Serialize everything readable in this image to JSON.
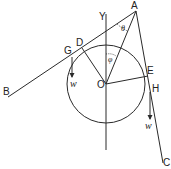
{
  "diagram": {
    "points": {
      "A": "A",
      "B": "B",
      "C": "C",
      "D": "D",
      "E": "E",
      "G": "G",
      "H": "H",
      "O": "O",
      "Y": "Y"
    },
    "angles": {
      "theta": "θ",
      "phi": "φ"
    },
    "weights": {
      "left": "w",
      "right": "w"
    },
    "colors": {
      "stroke": "#2a2a2a",
      "background": "#ffffff"
    }
  }
}
